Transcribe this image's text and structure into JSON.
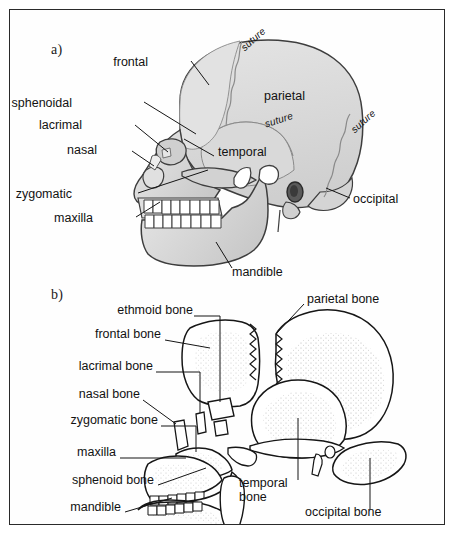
{
  "figure": {
    "frame_color": "#2a2a2a",
    "background_color": "#ffffff"
  },
  "panel_a": {
    "marker": "a)",
    "description": "Intact lateral view of skull with shaded bones and sutures",
    "bone_fill": "#dcdcdc",
    "outline_color": "#3a3a3a",
    "labels": [
      {
        "id": "frontal",
        "text": "frontal",
        "x": 138,
        "y": 53,
        "align": "right"
      },
      {
        "id": "sphenoidal",
        "text": "sphenoidal",
        "x": 62,
        "y": 94,
        "align": "right"
      },
      {
        "id": "lacrimal",
        "text": "lacrimal",
        "x": 72,
        "y": 116,
        "align": "right"
      },
      {
        "id": "nasal",
        "text": "nasal",
        "x": 87,
        "y": 141,
        "align": "right"
      },
      {
        "id": "zygomatic",
        "text": "zygomatic",
        "x": 62,
        "y": 185,
        "align": "right"
      },
      {
        "id": "maxilla",
        "text": "maxilla",
        "x": 83,
        "y": 209,
        "align": "right"
      },
      {
        "id": "parietal",
        "text": "parietal",
        "x": 254,
        "y": 86,
        "align": "left"
      },
      {
        "id": "temporal",
        "text": "temporal",
        "x": 208,
        "y": 142,
        "align": "left"
      },
      {
        "id": "occipital",
        "text": "occipital",
        "x": 343,
        "y": 190,
        "align": "left"
      },
      {
        "id": "mandible",
        "text": "mandible",
        "x": 222,
        "y": 262,
        "align": "left"
      }
    ],
    "suture_labels": [
      {
        "id": "suture-coronal",
        "text": "suture",
        "x": 228,
        "y": 38,
        "rotate": -42
      },
      {
        "id": "suture-squamous",
        "text": "suture",
        "x": 255,
        "y": 112,
        "rotate": -18
      },
      {
        "id": "suture-lambdoid",
        "text": "suture",
        "x": 338,
        "y": 120,
        "rotate": -42
      }
    ]
  },
  "panel_b": {
    "marker": "b)",
    "description": "Exploded (disarticulated) lateral view of skull bones with stippled shading",
    "bone_fill": "#ffffff",
    "outline_color": "#151515",
    "labels": [
      {
        "id": "ethmoid-bone",
        "text": "ethmoid bone",
        "x": 183,
        "y": 301,
        "align": "right"
      },
      {
        "id": "parietal-bone",
        "text": "parietal bone",
        "x": 297,
        "y": 289,
        "align": "left"
      },
      {
        "id": "frontal-bone",
        "text": "frontal bone",
        "x": 151,
        "y": 326,
        "align": "right"
      },
      {
        "id": "lacrimal-bone",
        "text": "lacrimal bone",
        "x": 143,
        "y": 358,
        "align": "right"
      },
      {
        "id": "nasal-bone",
        "text": "nasal bone",
        "x": 130,
        "y": 387,
        "align": "right"
      },
      {
        "id": "zygomatic-bone",
        "text": "zygomatic bone",
        "x": 148,
        "y": 413,
        "align": "right"
      },
      {
        "id": "maxilla",
        "text": "maxilla",
        "x": 106,
        "y": 444,
        "align": "right"
      },
      {
        "id": "sphenoid-bone",
        "text": "sphenoid bone",
        "x": 144,
        "y": 472,
        "align": "right"
      },
      {
        "id": "mandible",
        "text": "mandible",
        "x": 111,
        "y": 499,
        "align": "right"
      },
      {
        "id": "occipital-bone",
        "text": "occipital bone",
        "x": 295,
        "y": 503,
        "align": "left"
      }
    ],
    "wrapped_labels": [
      {
        "id": "temporal-bone",
        "line1": "temporal",
        "line2": "bone",
        "x": 229,
        "y": 473
      }
    ]
  }
}
